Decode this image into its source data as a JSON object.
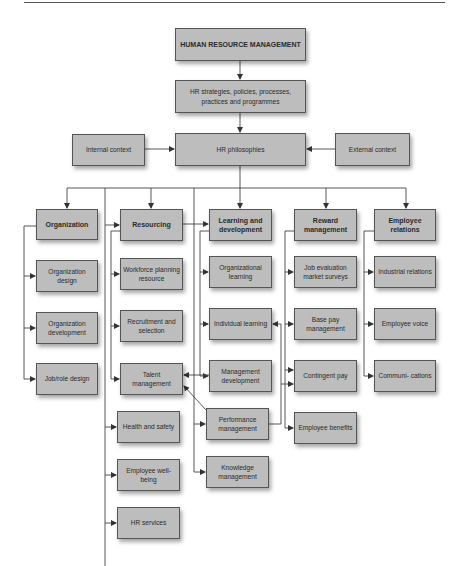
{
  "diagram": {
    "title": "HUMAN RESOURCE MANAGEMENT",
    "colors": {
      "box_fill": "#bdbdbd",
      "box_border": "#555555",
      "line": "#444444",
      "background": "#ffffff"
    },
    "top": {
      "hrm": "HUMAN RESOURCE MANAGEMENT",
      "strategies": "HR strategies, policies, processes, practices and programmes",
      "philosophies": "HR philosophies",
      "internal_context": "Internal context",
      "external_context": "External context"
    },
    "areas": [
      {
        "label": "Organization",
        "items": [
          "Organization design",
          "Organization development",
          "Job/role design"
        ]
      },
      {
        "label": "Resourcing",
        "items": [
          "Workforce planning resource",
          "Recruitment and selection",
          "Talent management",
          "Health and safety",
          "Employee well-being",
          "HR services"
        ]
      },
      {
        "label": "Learning and development",
        "items": [
          "Organizational learning",
          "Individual learning",
          "Management development",
          "Performance management",
          "Knowledge management"
        ]
      },
      {
        "label": "Reward management",
        "items": [
          "Job evaluation market surveys",
          "Base pay management",
          "Contingent pay",
          "Employee benefits"
        ]
      },
      {
        "label": "Employee relations",
        "items": [
          "Industrial relations",
          "Employee voice",
          "Communi- cations"
        ]
      }
    ]
  }
}
